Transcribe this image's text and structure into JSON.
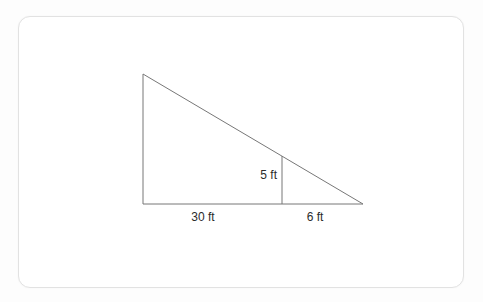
{
  "figure": {
    "type": "right-triangle-with-interior-altitude",
    "labels": {
      "altitude": "5 ft",
      "base_left": "30 ft",
      "base_right": "6 ft"
    },
    "colors": {
      "line": "#777777",
      "text": "#2b2b2b",
      "card_border": "#e2e2e2",
      "card_background": "#ffffff",
      "page_background": "#fdfdfd"
    }
  }
}
